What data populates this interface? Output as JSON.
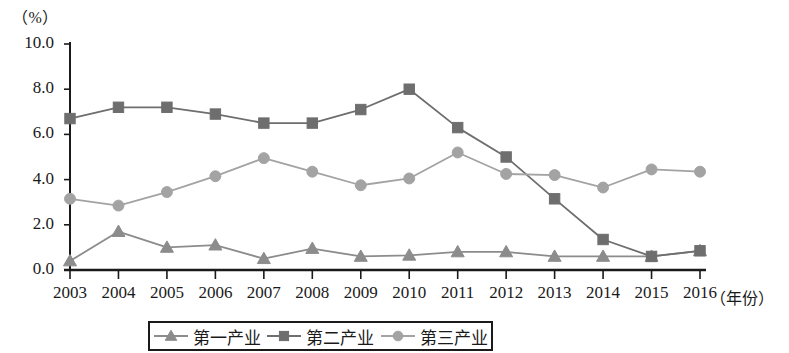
{
  "chart_data": {
    "type": "line",
    "title": "",
    "subtitle": "",
    "xlabel": "（年份）",
    "ylabel": "（%）",
    "unit_label": "（%）",
    "categories": [
      "2003",
      "2004",
      "2005",
      "2006",
      "2007",
      "2008",
      "2009",
      "2010",
      "2011",
      "2012",
      "2013",
      "2014",
      "2015",
      "2016"
    ],
    "x": [
      2003,
      2004,
      2005,
      2006,
      2007,
      2008,
      2009,
      2010,
      2011,
      2012,
      2013,
      2014,
      2015,
      2016
    ],
    "ylim": [
      0.0,
      10.0
    ],
    "yticks": [
      "0.0",
      "2.0",
      "4.0",
      "6.0",
      "8.0",
      "10.0"
    ],
    "ytick_values": [
      0.0,
      2.0,
      4.0,
      6.0,
      8.0,
      10.0
    ],
    "grid": false,
    "legend_position": "bottom",
    "series": [
      {
        "name": "第一产业",
        "marker": "triangle",
        "color": "#8c8c8c",
        "values": [
          0.4,
          1.7,
          1.0,
          1.1,
          0.5,
          0.95,
          0.6,
          0.65,
          0.8,
          0.8,
          0.6,
          0.6,
          0.6,
          0.85
        ]
      },
      {
        "name": "第二产业",
        "marker": "square",
        "color": "#6e6e6e",
        "values": [
          6.7,
          7.2,
          7.2,
          6.9,
          6.5,
          6.5,
          7.1,
          8.0,
          6.3,
          5.0,
          3.15,
          1.35,
          0.6,
          0.85
        ]
      },
      {
        "name": "第三产业",
        "marker": "circle",
        "color": "#a3a3a3",
        "values": [
          3.15,
          2.85,
          3.45,
          4.15,
          4.95,
          4.35,
          3.75,
          4.05,
          5.2,
          4.25,
          4.2,
          3.65,
          4.45,
          4.35
        ]
      }
    ]
  },
  "legend": {
    "items": [
      {
        "label": "第一产业",
        "marker": "triangle",
        "color": "#8c8c8c"
      },
      {
        "label": "第二产业",
        "marker": "square",
        "color": "#6e6e6e"
      },
      {
        "label": "第三产业",
        "marker": "circle",
        "color": "#a3a3a3"
      }
    ]
  },
  "axis": {
    "color": "#1a1a1a"
  }
}
